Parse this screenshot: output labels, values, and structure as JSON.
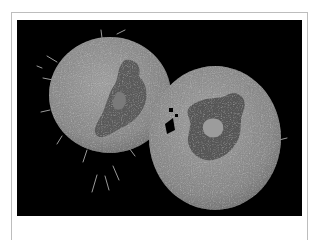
{
  "figure": {
    "style": "grayscale-scanning-electron-micrograph",
    "colors": {
      "background": "#000000",
      "cytoplasm": "#8e8e8e",
      "cytoplasm_highlight": "#a8a8a8",
      "nucleus": "#5a5a5a",
      "nucleus_dark": "#4a4a4a",
      "frame_border": "#bdbdbd",
      "page": "#ffffff"
    },
    "cells": [
      {
        "name": "left-cell",
        "cx": 93,
        "cy": 75,
        "rx": 61,
        "ry": 58
      },
      {
        "name": "right-cell",
        "cx": 198,
        "cy": 118,
        "rx": 66,
        "ry": 72
      }
    ]
  }
}
